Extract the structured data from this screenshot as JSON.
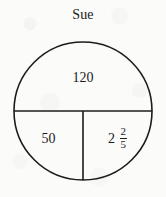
{
  "figure": {
    "title": "Sue",
    "shape": "circle-divided-into-three-regions",
    "stroke_color": "#1c1c1c",
    "background_color": "#fbfbfa",
    "regions": [
      {
        "name": "top-semicircle",
        "label": "120"
      },
      {
        "name": "bottom-left-quadrant",
        "label": "50"
      },
      {
        "name": "bottom-right-quadrant",
        "label": "2 2/5",
        "whole": "2",
        "numerator": "2",
        "denominator": "5"
      }
    ]
  }
}
